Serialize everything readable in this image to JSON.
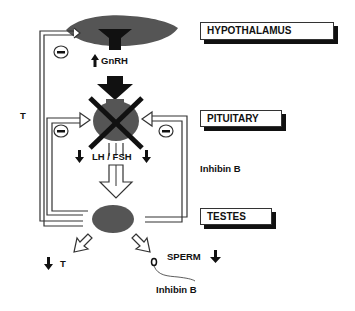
{
  "diagram": {
    "type": "hypothalamic-pituitary-gonadal axis feedback",
    "organs": {
      "hypothalamus": "HYPOTHALAMUS",
      "pituitary": "PITUITARY",
      "testes": "TESTES"
    },
    "hormones": {
      "gnrh": "GnRH",
      "lh_fsh": "LH / FSH",
      "inhibin_right": "Inhibin B",
      "inhibin_bottom": "Inhibin B",
      "testosterone_feedback": "T",
      "testosterone_output": "T",
      "sperm": "SPERM"
    },
    "indicators": {
      "gnrh_arrow": "↑",
      "lh_left_arrow": "↓",
      "fsh_right_arrow": "↓",
      "t_output_arrow": "↓",
      "sperm_arrow": "↓",
      "inhibit_symbol": "−"
    },
    "colors": {
      "organ_fill": "#555555",
      "line": "#333333",
      "black": "#111111"
    }
  }
}
